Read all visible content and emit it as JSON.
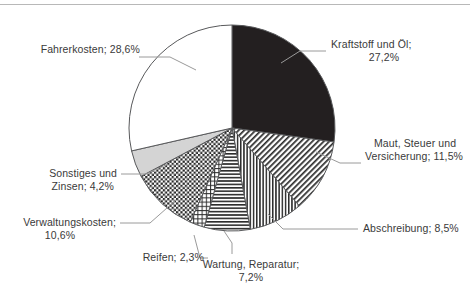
{
  "chart_data": {
    "type": "pie",
    "title": "",
    "subtitle": "",
    "xlabel": "",
    "ylabel": "",
    "legend_position": "none",
    "grid": false,
    "value_unit": "%",
    "decimal_separator": ",",
    "start_angle_deg": 0,
    "direction": "clockwise",
    "categories": [
      "Kraftstoff und Öl",
      "Maut, Steuer und Versicherung",
      "Abschreibung",
      "Wartung, Reparatur",
      "Reifen",
      "Verwaltungskosten",
      "Sonstiges und Zinsen",
      "Fahrerkosten"
    ],
    "values": [
      27.2,
      11.5,
      8.5,
      7.2,
      2.3,
      10.6,
      4.2,
      28.6
    ],
    "slices": [
      {
        "name": "Kraftstoff und Öl",
        "value": 27.2,
        "value_text": "27,2%",
        "label_line1": "Kraftstoff und Öl;",
        "label_line2": "27,2%",
        "fill": "#231f20",
        "pattern": "solid-black"
      },
      {
        "name": "Maut, Steuer und Versicherung",
        "value": 11.5,
        "value_text": "11,5%",
        "label_line1": "Maut, Steuer und",
        "label_line2": "Versicherung; 11,5%",
        "fill": "#ffffff",
        "pattern": "diagonal-hatch"
      },
      {
        "name": "Abschreibung",
        "value": 8.5,
        "value_text": "8,5%",
        "label_line1": "Abschreibung; 8,5%",
        "label_line2": "",
        "fill": "#ffffff",
        "pattern": "vertical-lines"
      },
      {
        "name": "Wartung, Reparatur",
        "value": 7.2,
        "value_text": "7,2%",
        "label_line1": "Wartung, Reparatur;",
        "label_line2": "7,2%",
        "fill": "#ffffff",
        "pattern": "horizontal-lines"
      },
      {
        "name": "Reifen",
        "value": 2.3,
        "value_text": "2,3%",
        "label_line1": "Reifen; 2,3%",
        "label_line2": "",
        "fill": "#ffffff",
        "pattern": "grid-lines"
      },
      {
        "name": "Verwaltungskosten",
        "value": 10.6,
        "value_text": "10,6%",
        "label_line1": "Verwaltungskosten;",
        "label_line2": "10,6%",
        "fill": "#ffffff",
        "pattern": "checkerboard"
      },
      {
        "name": "Sonstiges und Zinsen",
        "value": 4.2,
        "value_text": "4,2%",
        "label_line1": "Sonstiges und",
        "label_line2": "Zinsen; 4,2%",
        "fill": "#d4d4d4",
        "pattern": "solid-light-gray"
      },
      {
        "name": "Fahrerkosten",
        "value": 28.6,
        "value_text": "28,6%",
        "label_line1": "Fahrerkosten; 28,6%",
        "label_line2": "",
        "fill": "#ffffff",
        "pattern": "solid-white"
      }
    ],
    "colors": {
      "outline": "#58595b",
      "text": "#3a3a3a",
      "leader_line": "#9a9a9a",
      "background": "#ffffff"
    }
  }
}
